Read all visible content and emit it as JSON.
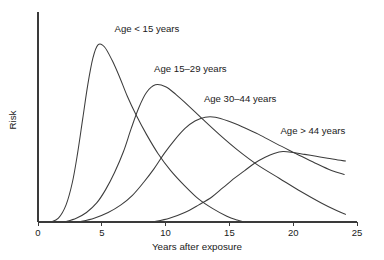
{
  "chart_data": {
    "type": "line",
    "title": "",
    "xlabel": "Years after exposure",
    "ylabel": "Risk",
    "xlim": [
      0,
      25
    ],
    "ylim": [
      0,
      1.05
    ],
    "xticks": [
      "0",
      "5",
      "10",
      "15",
      "20",
      "25"
    ],
    "xtick_values": [
      0,
      5,
      10,
      15,
      20,
      25
    ],
    "yticks": [],
    "grid": false,
    "legend": "inline-annotations",
    "series": [
      {
        "name": "Age < 15 years",
        "label": "Age < 15 years",
        "label_x": 6.0,
        "label_y": 1.0,
        "peak_x": 4.7,
        "peak_y": 0.93,
        "x": [
          1.0,
          1.6,
          2.2,
          2.7,
          3.1,
          3.5,
          3.9,
          4.3,
          4.7,
          5.2,
          5.8,
          6.4,
          7.0,
          7.7,
          8.5,
          9.4,
          10.4,
          11.5,
          12.6,
          13.7,
          14.8,
          15.6,
          16.2
        ],
        "y": [
          0.0,
          0.02,
          0.09,
          0.21,
          0.36,
          0.54,
          0.72,
          0.86,
          0.93,
          0.92,
          0.85,
          0.76,
          0.66,
          0.56,
          0.46,
          0.36,
          0.27,
          0.19,
          0.12,
          0.07,
          0.03,
          0.01,
          0.0
        ]
      },
      {
        "name": "Age 15-29 years",
        "label": "Age 15–29 years",
        "label_x": 9.1,
        "label_y": 0.79,
        "peak_x": 9.2,
        "peak_y": 0.72,
        "x": [
          2.1,
          3.0,
          3.8,
          4.6,
          5.3,
          6.0,
          6.7,
          7.3,
          7.9,
          8.5,
          9.2,
          10.0,
          10.8,
          11.8,
          12.9,
          14.2,
          15.6,
          17.2,
          18.9,
          20.6,
          22.2,
          23.4,
          24.1
        ],
        "y": [
          0.0,
          0.02,
          0.05,
          0.1,
          0.17,
          0.26,
          0.37,
          0.49,
          0.6,
          0.68,
          0.72,
          0.71,
          0.67,
          0.61,
          0.54,
          0.46,
          0.38,
          0.3,
          0.23,
          0.16,
          0.1,
          0.06,
          0.04
        ]
      },
      {
        "name": "Age 30-44 years",
        "label": "Age 30–44 years",
        "label_x": 13.0,
        "label_y": 0.63,
        "peak_x": 13.5,
        "peak_y": 0.55,
        "x": [
          3.2,
          4.4,
          5.5,
          6.5,
          7.4,
          8.3,
          9.1,
          9.9,
          10.7,
          11.5,
          12.3,
          13.1,
          13.9,
          14.9,
          16.0,
          17.3,
          18.7,
          20.2,
          21.7,
          23.0,
          24.0
        ],
        "y": [
          0.0,
          0.02,
          0.05,
          0.09,
          0.14,
          0.21,
          0.28,
          0.36,
          0.43,
          0.49,
          0.53,
          0.55,
          0.55,
          0.53,
          0.5,
          0.46,
          0.41,
          0.36,
          0.31,
          0.27,
          0.25
        ]
      },
      {
        "name": "Age > 44 years",
        "label": "Age > 44 years",
        "label_x": 19.0,
        "label_y": 0.46,
        "peak_x": 19.0,
        "peak_y": 0.37,
        "x": [
          9.0,
          10.3,
          11.5,
          12.6,
          13.6,
          14.5,
          15.4,
          16.2,
          17.0,
          17.8,
          18.5,
          19.2,
          20.0,
          20.9,
          21.8,
          22.7,
          23.5,
          24.1
        ],
        "y": [
          0.0,
          0.02,
          0.05,
          0.09,
          0.13,
          0.18,
          0.23,
          0.27,
          0.31,
          0.34,
          0.36,
          0.37,
          0.365,
          0.355,
          0.345,
          0.335,
          0.325,
          0.32
        ]
      }
    ]
  },
  "colors": {
    "background": "#ffffff",
    "axis": "#3a3a3a",
    "curve": "#3c3c3c",
    "text": "#1a1a1a"
  }
}
